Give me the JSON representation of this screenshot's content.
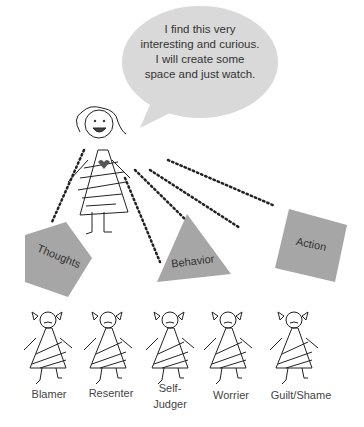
{
  "bubble": {
    "text": "I find this very interesting and curious. I will create some space and just watch."
  },
  "shapes": {
    "thoughts": "Thoughts",
    "behavior": "Behavior",
    "action": "Action"
  },
  "characters": [
    {
      "label": "Blamer"
    },
    {
      "label": "Resenter"
    },
    {
      "label": "Self-\nJudger"
    },
    {
      "label": "Worrier"
    },
    {
      "label": "Guilt/Shame"
    }
  ],
  "colors": {
    "shape_fill": "#a6a6a6",
    "bubble_fill": "#d9d9d9",
    "heart": "#555555"
  }
}
